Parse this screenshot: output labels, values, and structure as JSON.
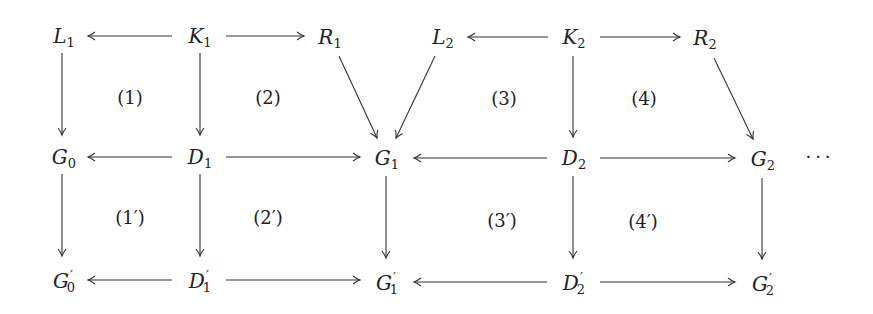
{
  "diagram": {
    "type": "commutative-diagram",
    "nodes": {
      "L1": {
        "base": "L",
        "sub": "1",
        "prime": ""
      },
      "K1": {
        "base": "K",
        "sub": "1",
        "prime": ""
      },
      "R1": {
        "base": "R",
        "sub": "1",
        "prime": ""
      },
      "L2": {
        "base": "L",
        "sub": "2",
        "prime": ""
      },
      "K2": {
        "base": "K",
        "sub": "2",
        "prime": ""
      },
      "R2": {
        "base": "R",
        "sub": "2",
        "prime": ""
      },
      "G0": {
        "base": "G",
        "sub": "0",
        "prime": ""
      },
      "D1": {
        "base": "D",
        "sub": "1",
        "prime": ""
      },
      "G1": {
        "base": "G",
        "sub": "1",
        "prime": ""
      },
      "D2": {
        "base": "D",
        "sub": "2",
        "prime": ""
      },
      "G2": {
        "base": "G",
        "sub": "2",
        "prime": ""
      },
      "G0p": {
        "base": "G",
        "sub": "0",
        "prime": "′"
      },
      "D1p": {
        "base": "D",
        "sub": "1",
        "prime": "′"
      },
      "G1p": {
        "base": "G",
        "sub": "1",
        "prime": "′"
      },
      "D2p": {
        "base": "D",
        "sub": "2",
        "prime": "′"
      },
      "G2p": {
        "base": "G",
        "sub": "2",
        "prime": "′"
      }
    },
    "square_labels": {
      "s1": "(1)",
      "s2": "(2)",
      "s3": "(3)",
      "s4": "(4)",
      "s1p": "(1′)",
      "s2p": "(2′)",
      "s3p": "(3′)",
      "s4p": "(4′)"
    },
    "continuation": "···",
    "edges": [
      {
        "from": "K1",
        "to": "L1"
      },
      {
        "from": "K1",
        "to": "R1"
      },
      {
        "from": "K2",
        "to": "L2"
      },
      {
        "from": "K2",
        "to": "R2"
      },
      {
        "from": "L1",
        "to": "G0"
      },
      {
        "from": "K1",
        "to": "D1"
      },
      {
        "from": "R1",
        "to": "G1"
      },
      {
        "from": "L2",
        "to": "G1"
      },
      {
        "from": "K2",
        "to": "D2"
      },
      {
        "from": "R2",
        "to": "G2"
      },
      {
        "from": "D1",
        "to": "G0"
      },
      {
        "from": "D1",
        "to": "G1"
      },
      {
        "from": "D2",
        "to": "G1"
      },
      {
        "from": "D2",
        "to": "G2"
      },
      {
        "from": "G0",
        "to": "G0p"
      },
      {
        "from": "D1",
        "to": "D1p"
      },
      {
        "from": "G1",
        "to": "G1p"
      },
      {
        "from": "D2",
        "to": "D2p"
      },
      {
        "from": "G2",
        "to": "G2p"
      },
      {
        "from": "D1p",
        "to": "G0p"
      },
      {
        "from": "D1p",
        "to": "G1p"
      },
      {
        "from": "D2p",
        "to": "G1p"
      },
      {
        "from": "D2p",
        "to": "G2p"
      }
    ]
  }
}
